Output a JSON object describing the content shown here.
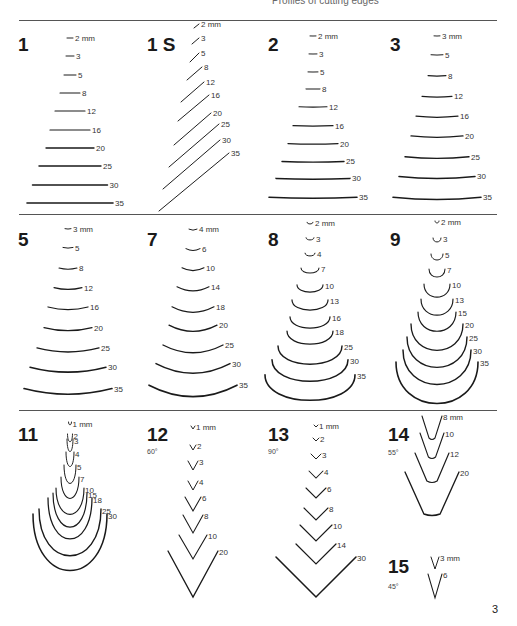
{
  "header": {
    "title": "Profiles of cutting edges"
  },
  "page_number": "3",
  "rules_y": [
    20,
    214,
    410
  ],
  "sections": [
    {
      "id": "1",
      "label": "1",
      "kind": "flat",
      "num_pos": [
        18,
        35
      ],
      "cx": 70,
      "items": [
        {
          "size": "2 mm",
          "y": 38,
          "w": 6
        },
        {
          "size": "3",
          "y": 56,
          "w": 8
        },
        {
          "size": "5",
          "y": 75,
          "w": 12
        },
        {
          "size": "8",
          "y": 93,
          "w": 20
        },
        {
          "size": "12",
          "y": 111,
          "w": 30
        },
        {
          "size": "16",
          "y": 130,
          "w": 40
        },
        {
          "size": "20",
          "y": 148,
          "w": 48
        },
        {
          "size": "25",
          "y": 166,
          "w": 62
        },
        {
          "size": "30",
          "y": 185,
          "w": 75
        },
        {
          "size": "35",
          "y": 203,
          "w": 86
        }
      ]
    },
    {
      "id": "1S",
      "label": "1 S",
      "kind": "skew",
      "num_pos": [
        147,
        35
      ],
      "items": [
        {
          "size": "2 mm",
          "x1": 194,
          "y1": 28,
          "x2": 199,
          "y2": 24
        },
        {
          "size": "3",
          "x1": 192,
          "y1": 44,
          "x2": 199,
          "y2": 38
        },
        {
          "size": "5",
          "x1": 190,
          "y1": 62,
          "x2": 199,
          "y2": 53
        },
        {
          "size": "8",
          "x1": 187,
          "y1": 80,
          "x2": 202,
          "y2": 67
        },
        {
          "size": "12",
          "x1": 181,
          "y1": 102,
          "x2": 204,
          "y2": 82
        },
        {
          "size": "16",
          "x1": 178,
          "y1": 121,
          "x2": 209,
          "y2": 95
        },
        {
          "size": "20",
          "x1": 174,
          "y1": 145,
          "x2": 211,
          "y2": 113
        },
        {
          "size": "25",
          "x1": 169,
          "y1": 167,
          "x2": 219,
          "y2": 124
        },
        {
          "size": "30",
          "x1": 163,
          "y1": 189,
          "x2": 220,
          "y2": 140
        },
        {
          "size": "35",
          "x1": 159,
          "y1": 211,
          "x2": 229,
          "y2": 153
        }
      ]
    },
    {
      "id": "2",
      "label": "2",
      "kind": "curve",
      "bend": 0.5,
      "num_pos": [
        268,
        35
      ],
      "cx": 313,
      "items": [
        {
          "size": "2 mm",
          "y": 36,
          "w": 6
        },
        {
          "size": "3",
          "y": 54,
          "w": 8
        },
        {
          "size": "5",
          "y": 72,
          "w": 10
        },
        {
          "size": "8",
          "y": 89,
          "w": 14
        },
        {
          "size": "12",
          "y": 107,
          "w": 28
        },
        {
          "size": "16",
          "y": 126,
          "w": 40
        },
        {
          "size": "20",
          "y": 144,
          "w": 50
        },
        {
          "size": "25",
          "y": 162,
          "w": 62
        },
        {
          "size": "30",
          "y": 179,
          "w": 74
        },
        {
          "size": "35",
          "y": 198,
          "w": 88
        }
      ]
    },
    {
      "id": "3",
      "label": "3",
      "kind": "curve",
      "bend": 1.2,
      "num_pos": [
        390,
        35
      ],
      "cx": 437,
      "items": [
        {
          "size": "3 mm",
          "y": 36,
          "w": 6
        },
        {
          "size": "5",
          "y": 55,
          "w": 12
        },
        {
          "size": "8",
          "y": 76,
          "w": 18
        },
        {
          "size": "12",
          "y": 97,
          "w": 30
        },
        {
          "size": "16",
          "y": 117,
          "w": 42
        },
        {
          "size": "20",
          "y": 137,
          "w": 52
        },
        {
          "size": "25",
          "y": 158,
          "w": 64
        },
        {
          "size": "30",
          "y": 178,
          "w": 76
        },
        {
          "size": "35",
          "y": 199,
          "w": 88
        }
      ]
    },
    {
      "id": "5",
      "label": "5",
      "kind": "curve",
      "bend": 3,
      "num_pos": [
        18,
        230
      ],
      "cx": 68,
      "items": [
        {
          "size": "3 mm",
          "y": 229,
          "w": 6
        },
        {
          "size": "5",
          "y": 248,
          "w": 10
        },
        {
          "size": "8",
          "y": 269,
          "w": 18
        },
        {
          "size": "12",
          "y": 289,
          "w": 28
        },
        {
          "size": "16",
          "y": 309,
          "w": 40
        },
        {
          "size": "20",
          "y": 330,
          "w": 48
        },
        {
          "size": "25",
          "y": 351,
          "w": 62
        },
        {
          "size": "30",
          "y": 371,
          "w": 76
        },
        {
          "size": "35",
          "y": 393,
          "w": 88
        }
      ]
    },
    {
      "id": "7",
      "label": "7",
      "kind": "curve",
      "bend": 6,
      "num_pos": [
        147,
        230
      ],
      "cx": 193,
      "items": [
        {
          "size": "4 mm",
          "y": 230,
          "w": 8
        },
        {
          "size": "6",
          "y": 250,
          "w": 14
        },
        {
          "size": "10",
          "y": 270,
          "w": 22
        },
        {
          "size": "14",
          "y": 290,
          "w": 32
        },
        {
          "size": "18",
          "y": 311,
          "w": 42
        },
        {
          "size": "20",
          "y": 330,
          "w": 48
        },
        {
          "size": "25",
          "y": 351,
          "w": 60
        },
        {
          "size": "30",
          "y": 371,
          "w": 74
        },
        {
          "size": "35",
          "y": 394,
          "w": 88
        }
      ]
    },
    {
      "id": "8",
      "label": "8",
      "kind": "arc",
      "depth": 0.28,
      "num_pos": [
        268,
        230
      ],
      "cx": 310,
      "items": [
        {
          "size": "2 mm",
          "y": 224,
          "w": 6
        },
        {
          "size": "3",
          "y": 240,
          "w": 8
        },
        {
          "size": "4",
          "y": 256,
          "w": 10
        },
        {
          "size": "7",
          "y": 273,
          "w": 18
        },
        {
          "size": "10",
          "y": 292,
          "w": 26
        },
        {
          "size": "13",
          "y": 310,
          "w": 36
        },
        {
          "size": "16",
          "y": 328,
          "w": 40
        },
        {
          "size": "18",
          "y": 344,
          "w": 46
        },
        {
          "size": "25",
          "y": 364,
          "w": 64
        },
        {
          "size": "30",
          "y": 381,
          "w": 76
        },
        {
          "size": "35",
          "y": 400,
          "w": 90
        }
      ]
    },
    {
      "id": "9",
      "label": "9",
      "kind": "arc",
      "depth": 0.5,
      "num_pos": [
        390,
        230
      ],
      "cx": 437,
      "items": [
        {
          "size": "2 mm",
          "y": 223,
          "w": 4
        },
        {
          "size": "3",
          "y": 242,
          "w": 8
        },
        {
          "size": "5",
          "y": 260,
          "w": 12
        },
        {
          "size": "7",
          "y": 277,
          "w": 16
        },
        {
          "size": "10",
          "y": 297,
          "w": 26
        },
        {
          "size": "13",
          "y": 315,
          "w": 32
        },
        {
          "size": "15",
          "y": 331,
          "w": 38
        },
        {
          "size": "20",
          "y": 350,
          "w": 52
        },
        {
          "size": "25",
          "y": 367,
          "w": 60
        },
        {
          "size": "30",
          "y": 384,
          "w": 68
        },
        {
          "size": "35",
          "y": 403,
          "w": 82
        }
      ]
    },
    {
      "id": "11",
      "label": "11",
      "kind": "u",
      "num_pos": [
        18,
        425
      ],
      "cx": 70,
      "items": [
        {
          "size": "1 mm",
          "y": 425,
          "w": 3,
          "d": 3
        },
        {
          "size": "2",
          "y": 442,
          "w": 5,
          "d": 8
        },
        {
          "size": "3",
          "y": 452,
          "w": 6,
          "d": 13
        },
        {
          "size": "4",
          "y": 467,
          "w": 8,
          "d": 15
        },
        {
          "size": "5",
          "y": 484,
          "w": 12,
          "d": 19
        },
        {
          "size": "7",
          "y": 499,
          "w": 18,
          "d": 22
        },
        {
          "size": "10",
          "y": 515,
          "w": 28,
          "d": 27
        },
        {
          "size": "15",
          "y": 528,
          "w": 34,
          "d": 35
        },
        {
          "size": "18",
          "y": 540,
          "w": 44,
          "d": 42
        },
        {
          "size": "25",
          "y": 557,
          "w": 62,
          "d": 48
        },
        {
          "size": "30",
          "y": 572,
          "w": 74,
          "d": 58
        }
      ]
    },
    {
      "id": "12",
      "label": "12",
      "kind": "v",
      "num_pos": [
        147,
        425
      ],
      "angle_label": "60°",
      "angle_pos": [
        147,
        448
      ],
      "cx": 193,
      "items": [
        {
          "size": "1 mm",
          "y": 429,
          "w": 4,
          "d": 3
        },
        {
          "size": "2",
          "y": 450,
          "w": 6,
          "d": 5
        },
        {
          "size": "3",
          "y": 470,
          "w": 10,
          "d": 9
        },
        {
          "size": "4",
          "y": 490,
          "w": 10,
          "d": 9
        },
        {
          "size": "6",
          "y": 511,
          "w": 16,
          "d": 14
        },
        {
          "size": "8",
          "y": 533,
          "w": 20,
          "d": 18
        },
        {
          "size": "10",
          "y": 559,
          "w": 28,
          "d": 24
        },
        {
          "size": "20",
          "y": 597,
          "w": 50,
          "d": 46
        }
      ]
    },
    {
      "id": "13",
      "label": "13",
      "kind": "v",
      "num_pos": [
        268,
        425
      ],
      "angle_label": "90°",
      "angle_pos": [
        268,
        448
      ],
      "cx": 316,
      "items": [
        {
          "size": "1 mm",
          "y": 427,
          "w": 4,
          "d": 2
        },
        {
          "size": "2",
          "y": 441,
          "w": 6,
          "d": 3
        },
        {
          "size": "3",
          "y": 459,
          "w": 10,
          "d": 5
        },
        {
          "size": "4",
          "y": 478,
          "w": 14,
          "d": 7
        },
        {
          "size": "6",
          "y": 498,
          "w": 20,
          "d": 10
        },
        {
          "size": "8",
          "y": 520,
          "w": 24,
          "d": 12
        },
        {
          "size": "10",
          "y": 541,
          "w": 32,
          "d": 16
        },
        {
          "size": "14",
          "y": 564,
          "w": 40,
          "d": 20
        },
        {
          "size": "30",
          "y": 597,
          "w": 80,
          "d": 40
        }
      ]
    },
    {
      "id": "14",
      "label": "14",
      "kind": "vr",
      "num_pos": [
        388,
        425
      ],
      "angle_label": "55°",
      "angle_pos": [
        388,
        449
      ],
      "cx": 432,
      "items": [
        {
          "size": "8 mm",
          "y": 440,
          "w": 20,
          "d": 24
        },
        {
          "size": "10",
          "y": 459,
          "w": 24,
          "d": 26
        },
        {
          "size": "12",
          "y": 483,
          "w": 34,
          "d": 30
        },
        {
          "size": "20",
          "y": 516,
          "w": 54,
          "d": 44
        }
      ]
    },
    {
      "id": "15",
      "label": "15",
      "kind": "v",
      "num_pos": [
        388,
        557
      ],
      "angle_label": "45°",
      "angle_pos": [
        388,
        583
      ],
      "cx": 435,
      "items": [
        {
          "size": "3 mm",
          "y": 569,
          "w": 8,
          "d": 12
        },
        {
          "size": "6",
          "y": 598,
          "w": 14,
          "d": 24
        }
      ]
    }
  ]
}
